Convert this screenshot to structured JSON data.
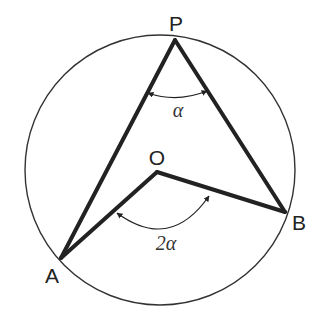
{
  "diagram": {
    "circle": {
      "cx": 160,
      "cy": 170,
      "r": 135,
      "stroke": "#333333"
    },
    "points": {
      "P": {
        "label": "P",
        "x": 175,
        "y": 40,
        "label_x": 176,
        "label_y": 31
      },
      "O": {
        "label": "O",
        "x": 157,
        "y": 172,
        "label_x": 157,
        "label_y": 165
      },
      "A": {
        "label": "A",
        "x": 61,
        "y": 258,
        "label_x": 52,
        "label_y": 283
      },
      "B": {
        "label": "B",
        "x": 285,
        "y": 212,
        "label_x": 299,
        "label_y": 230
      }
    },
    "angles": {
      "inscribed": {
        "label": "α",
        "at": "P",
        "label_x": 178,
        "label_y": 117
      },
      "central": {
        "label": "2α",
        "at": "O",
        "label_x": 166,
        "label_y": 250
      }
    },
    "segments": [
      "P-A",
      "P-B",
      "O-A",
      "O-B"
    ],
    "line_color": "#222222"
  }
}
